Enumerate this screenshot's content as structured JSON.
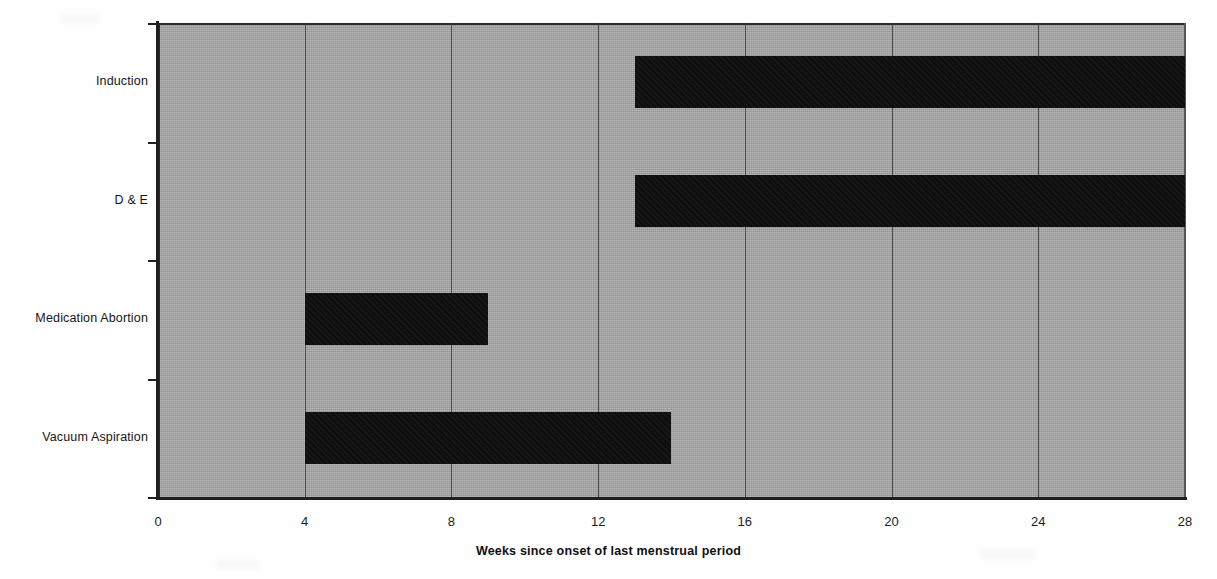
{
  "chart_data": {
    "type": "bar",
    "orientation": "horizontal",
    "subtype": "range-bar",
    "title": "",
    "xlabel": "Weeks since onset of last menstrual period",
    "ylabel": "",
    "xlim": [
      0,
      28
    ],
    "xticks": [
      0,
      4,
      8,
      12,
      16,
      20,
      24,
      28
    ],
    "xtick_labels": [
      "0",
      "4",
      "8",
      "12",
      "16",
      "20",
      "24",
      "28"
    ],
    "grid": true,
    "grid_axis": "x",
    "legend": "none",
    "categories": [
      "Induction",
      "D & E",
      "Medication Abortion",
      "Vacuum Aspiration"
    ],
    "ranges": [
      {
        "category": "Induction",
        "start": 13,
        "end": 28
      },
      {
        "category": "D & E",
        "start": 13,
        "end": 28
      },
      {
        "category": "Medication Abortion",
        "start": 4,
        "end": 9
      },
      {
        "category": "Vacuum Aspiration",
        "start": 4,
        "end": 14
      }
    ],
    "colors": {
      "bar": "#0d0d0d",
      "plot_background": "#a3a3a3",
      "gridline": "#3a3a3a",
      "axis": "#1f1f1f",
      "page_background": "#ffffff",
      "text": "#161616"
    }
  },
  "axis": {
    "x_title": "Weeks since onset of last menstrual period",
    "tick_labels": [
      "0",
      "4",
      "8",
      "12",
      "16",
      "20",
      "24",
      "28"
    ]
  },
  "categories": [
    {
      "label": "Induction"
    },
    {
      "label": "D & E"
    },
    {
      "label": "Medication Abortion"
    },
    {
      "label": "Vacuum Aspiration"
    }
  ]
}
